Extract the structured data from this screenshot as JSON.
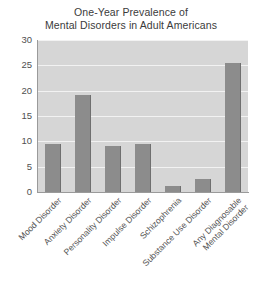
{
  "chart_data": {
    "type": "bar",
    "title": "One-Year Prevalence of Mental Disorders in Adult Americans",
    "title_lines": [
      "One-Year Prevalence of",
      "Mental Disorders in Adult Americans"
    ],
    "categories": [
      "Mood Disorder",
      "Anxiety Disorder",
      "Personality Disorder",
      "Impulse Disorder",
      "Schizophrenia",
      "Substance Use Disorder",
      "Any Diagnosable Mental Disorder"
    ],
    "category_lines": [
      [
        "Mood Disorder"
      ],
      [
        "Anxiety Disorder"
      ],
      [
        "Personality Disorder"
      ],
      [
        "Impulse Disorder"
      ],
      [
        "Schizophrenia"
      ],
      [
        "Substance Use Disorder"
      ],
      [
        "Any Diagnosable",
        "Mental Disorder"
      ]
    ],
    "values": [
      9.5,
      19.1,
      9.1,
      9.5,
      1.1,
      2.6,
      25.4
    ],
    "xlabel": "",
    "ylabel": "",
    "ylim": [
      0,
      30
    ],
    "yticks": [
      0,
      5,
      10,
      15,
      20,
      25,
      30
    ],
    "ytick_labels": [
      "0",
      "5",
      "10",
      "15",
      "20",
      "25",
      "30"
    ],
    "grid": true,
    "legend": false,
    "colors": {
      "bar": "#8c8c8c",
      "bar_edge": "#6f6f6f",
      "plot_background": "#d6d6d6",
      "gridline": "#f2f2f2",
      "axis": "#9a9a9a",
      "title_text": "#3b3b3b",
      "tick_text": "#4f4f4f",
      "label_text": "#555555",
      "page_background": "#ffffff"
    }
  }
}
